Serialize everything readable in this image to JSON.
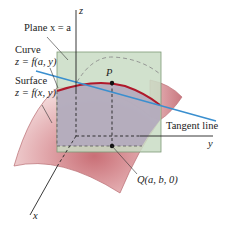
{
  "diagram": {
    "labels": {
      "plane": "Plane x = a",
      "curve_title": "Curve",
      "curve_eq": "z = f(a, y)",
      "surface_title": "Surface",
      "surface_eq": "z = f(x, y)",
      "point_p": "P",
      "tangent": "Tangent line",
      "point_q": "Q(a, b, 0)",
      "axis_x": "x",
      "axis_y": "y",
      "axis_z": "z"
    },
    "colors": {
      "surface_fill": "#e8b7b9",
      "surface_dark": "#c9787c",
      "plane_fill": "#c9dcc4",
      "plane_edge": "#7e9a76",
      "region_fill": "#b3a8bd",
      "curve": "#b0182a",
      "tangent": "#3a8fcf",
      "axis": "#222222"
    }
  }
}
